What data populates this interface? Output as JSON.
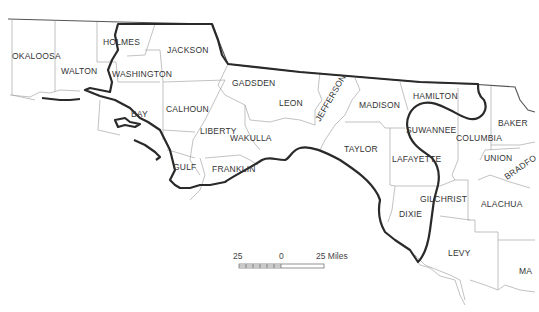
{
  "map": {
    "counties": [
      {
        "id": "okaloosa",
        "name": "OKALOOSA"
      },
      {
        "id": "walton",
        "name": "WALTON"
      },
      {
        "id": "holmes",
        "name": "HOLMES"
      },
      {
        "id": "jackson",
        "name": "JACKSON"
      },
      {
        "id": "washington",
        "name": "WASHINGTON"
      },
      {
        "id": "bay",
        "name": "BAY"
      },
      {
        "id": "calhoun",
        "name": "CALHOUN"
      },
      {
        "id": "gadsden",
        "name": "GADSDEN"
      },
      {
        "id": "liberty",
        "name": "LIBERTY"
      },
      {
        "id": "gulf",
        "name": "GULF"
      },
      {
        "id": "franklin",
        "name": "FRANKLIN"
      },
      {
        "id": "leon",
        "name": "LEON"
      },
      {
        "id": "wakulla",
        "name": "WAKULLA"
      },
      {
        "id": "jefferson",
        "name": "JEFFERSON"
      },
      {
        "id": "madison",
        "name": "MADISON"
      },
      {
        "id": "taylor",
        "name": "TAYLOR"
      },
      {
        "id": "hamilton",
        "name": "HAMILTON"
      },
      {
        "id": "suwannee",
        "name": "SUWANNEE"
      },
      {
        "id": "lafayette",
        "name": "LAFAYETTE"
      },
      {
        "id": "columbia",
        "name": "COLUMBIA"
      },
      {
        "id": "baker",
        "name": "BAKER"
      },
      {
        "id": "union",
        "name": "UNION"
      },
      {
        "id": "bradford",
        "name": "BRADFO"
      },
      {
        "id": "gilchrist",
        "name": "GILCHRIST"
      },
      {
        "id": "alachua",
        "name": "ALACHUA"
      },
      {
        "id": "dixie",
        "name": "DIXIE"
      },
      {
        "id": "levy",
        "name": "LEVY"
      },
      {
        "id": "marion",
        "name": "MA"
      }
    ],
    "scale": {
      "left_label": "25",
      "center_label": "0",
      "right_label": "25 Miles"
    }
  }
}
